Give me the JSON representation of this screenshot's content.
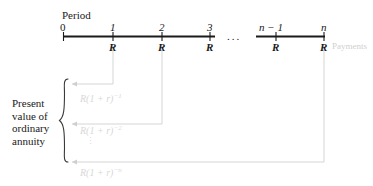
{
  "diagram": {
    "title_label": "Period",
    "payments_label": "Payments",
    "ellipsis": "...",
    "vertical_dots": "⋮",
    "timeline": {
      "tick_labels": [
        "0",
        "1",
        "2",
        "3",
        "n − 1",
        "n"
      ],
      "payment_labels": [
        "R",
        "R",
        "R",
        "R",
        "R"
      ],
      "break_symbol": "..."
    },
    "brace_label_lines": [
      "Present",
      "value of",
      "ordinary",
      "annuity"
    ],
    "discount_formulas": [
      {
        "base": "R(1 + r)",
        "exponent": "−1"
      },
      {
        "base": "R(1 + r)",
        "exponent": "−2"
      },
      {
        "base": "R(1 + r)",
        "exponent": "−n"
      }
    ],
    "colors": {
      "ink": "#1a1a1a",
      "faint": "#cfcfcf",
      "faint_line": "#d5d5d5"
    }
  }
}
